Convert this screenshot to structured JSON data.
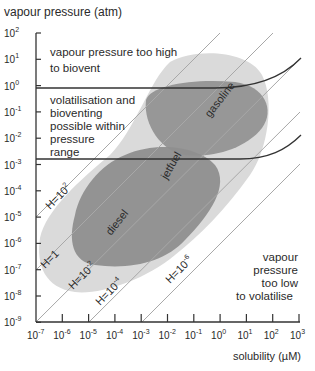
{
  "chart_data": {
    "type": "line",
    "title": "",
    "xlabel": "solubility (µM)",
    "ylabel": "vapour pressure (atm)",
    "xscale": "log",
    "yscale": "log",
    "xlim": [
      1e-07,
      1000.0
    ],
    "ylim": [
      1e-09,
      100.0
    ],
    "grid": false,
    "x_ticks": [
      "10-7",
      "10-6",
      "10-5",
      "10-4",
      "10-3",
      "10-2",
      "10-1",
      "100",
      "101",
      "102",
      "103"
    ],
    "y_ticks": [
      "102",
      "101",
      "100",
      "10-1",
      "10-2",
      "10-3",
      "10-4",
      "10-5",
      "10-6",
      "10-7",
      "10-8",
      "10-9"
    ],
    "series": [
      {
        "name": "H=10^2",
        "points": [
          [
            1e-07,
            1e-05
          ],
          [
            1.0,
            100.0
          ]
        ]
      },
      {
        "name": "H=1",
        "points": [
          [
            1e-07,
            1e-07
          ],
          [
            100.0,
            100.0
          ]
        ]
      },
      {
        "name": "H=10^-2",
        "points": [
          [
            1e-07,
            1e-09
          ],
          [
            1000.0,
            10.0
          ]
        ]
      },
      {
        "name": "H=10^-4",
        "points": [
          [
            1e-05,
            1e-09
          ],
          [
            1000.0,
            0.1
          ]
        ]
      },
      {
        "name": "H=10^-6",
        "points": [
          [
            0.001,
            1e-09
          ],
          [
            1000.0,
            0.001
          ]
        ]
      }
    ],
    "boundaries": [
      {
        "name": "upper pressure limit",
        "approx_y": 0.5,
        "curves_up_after_x": 1.0,
        "end": [
          1000.0,
          10.0
        ]
      },
      {
        "name": "lower pressure limit",
        "approx_y": 0.0015,
        "curves_up_after_x": 10.0,
        "end": [
          1000.0,
          0.01
        ]
      }
    ],
    "regions": [
      {
        "name": "gasoline",
        "approx_x": [
          0.001,
          100.0
        ],
        "approx_y": [
          0.001,
          0.1
        ]
      },
      {
        "name": "jetfuel",
        "approx_x": [
          0.0001,
          10.0
        ],
        "approx_y": [
          0.0001,
          0.01
        ]
      },
      {
        "name": "diesel",
        "approx_x": [
          1e-06,
          1.0
        ],
        "approx_y": [
          1e-07,
          0.001
        ]
      }
    ],
    "annotations": [
      "vapour pressure too high to biovent",
      "volatilisation and bioventing possible within pressure range",
      "vapour pressure too low to volatilise"
    ]
  },
  "axes": {
    "ylabel": "vapour pressure (atm)",
    "xlabel": "solubility (µM)",
    "x_ticks": [
      {
        "base": "10",
        "exp": "-7"
      },
      {
        "base": "10",
        "exp": "-6"
      },
      {
        "base": "10",
        "exp": "-5"
      },
      {
        "base": "10",
        "exp": "-4"
      },
      {
        "base": "10",
        "exp": "-3"
      },
      {
        "base": "10",
        "exp": "-2"
      },
      {
        "base": "10",
        "exp": "-1"
      },
      {
        "base": "10",
        "exp": "0"
      },
      {
        "base": "10",
        "exp": "1"
      },
      {
        "base": "10",
        "exp": "2"
      },
      {
        "base": "10",
        "exp": "3"
      }
    ],
    "y_ticks": [
      {
        "base": "10",
        "exp": "2"
      },
      {
        "base": "10",
        "exp": "1"
      },
      {
        "base": "10",
        "exp": "0"
      },
      {
        "base": "10",
        "exp": "-1"
      },
      {
        "base": "10",
        "exp": "-2"
      },
      {
        "base": "10",
        "exp": "-3"
      },
      {
        "base": "10",
        "exp": "-4"
      },
      {
        "base": "10",
        "exp": "-5"
      },
      {
        "base": "10",
        "exp": "-6"
      },
      {
        "base": "10",
        "exp": "-7"
      },
      {
        "base": "10",
        "exp": "-8"
      },
      {
        "base": "10",
        "exp": "-9"
      }
    ]
  },
  "regions": {
    "high": [
      "vapour pressure too high",
      "to biovent"
    ],
    "mid": [
      "volatilisation and",
      "bioventing",
      "possible within",
      "pressure",
      "range"
    ],
    "low": [
      "vapour",
      "pressure",
      "too low",
      "to volatilise"
    ]
  },
  "fuels": {
    "gasoline": "gasoline",
    "jetfuel": "jetfuel",
    "diesel": "diesel"
  },
  "lines": {
    "h2": {
      "base": "H=10",
      "exp": "2"
    },
    "h0": {
      "base": "H=1",
      "exp": ""
    },
    "hm2": {
      "base": "H=10",
      "exp": "-2"
    },
    "hm4": {
      "base": "H=10",
      "exp": "-4"
    },
    "hm6": {
      "base": "H=10",
      "exp": "-6"
    }
  },
  "colors": {
    "envelope": "#dcdcdc",
    "blob": "#8f8f8f",
    "line": "#aaaaaa",
    "boundary": "#333333",
    "axis": "#333333"
  }
}
